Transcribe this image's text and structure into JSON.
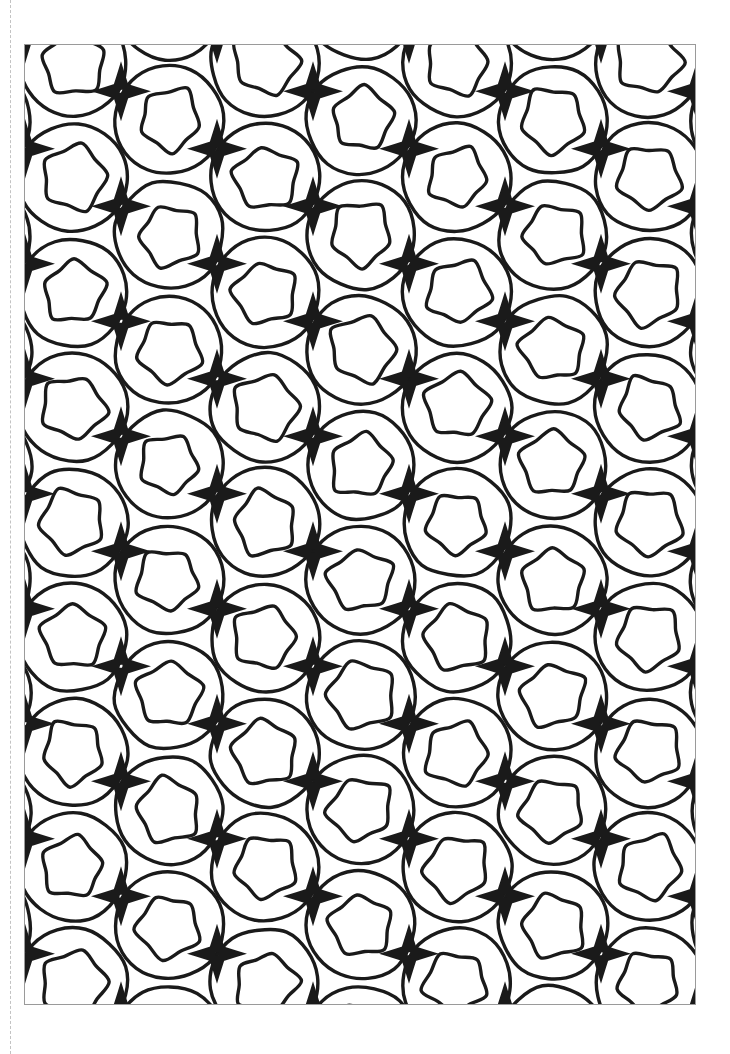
{
  "document": {
    "kind": "coloring-page",
    "orientation": "portrait",
    "page_width": 730,
    "page_height": 1054,
    "background_color": "#ffffff",
    "ink_color": "#1a1a1a",
    "frame_color": "#9a9a9a",
    "perforation_color": "#b9b9b9"
  },
  "perforation": {
    "name": "dashed-guide-line",
    "x": 10,
    "dash_length": 9,
    "gap_length": 7,
    "visible": true
  },
  "frame": {
    "name": "artwork-border",
    "x": 24,
    "y": 44,
    "width": 672,
    "height": 961,
    "stroke_width": 1
  },
  "pattern": {
    "name": "pentagon-circle-tessellation",
    "description": "Repeating line-art tessellation of overlapping circles each containing a rounded pentagon, with four-pointed concave stars filling the interstices.",
    "cell_width": 96,
    "cell_height": 115,
    "column_stagger_y": 57.5,
    "circle_radius": 54,
    "pentagon_radius": 33,
    "star_long_radius": 30,
    "star_short_radius": 9,
    "stroke_width": 3.4,
    "columns": 8,
    "rows": 10,
    "motifs": [
      {
        "name": "rounded-pentagon",
        "count_per_cell": 1
      },
      {
        "name": "enclosing-circle-arc",
        "count_per_cell": 1
      },
      {
        "name": "four-point-concave-star",
        "count_per_cell": 1
      }
    ]
  }
}
